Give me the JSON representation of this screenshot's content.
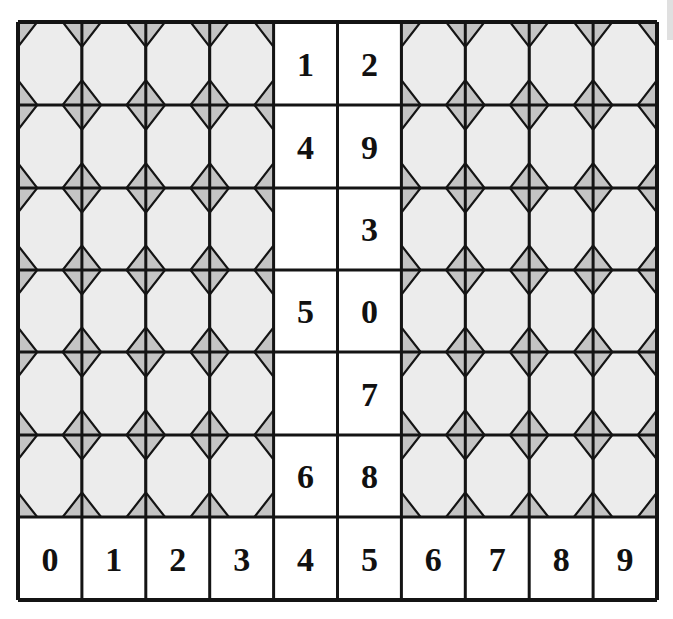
{
  "puzzle": {
    "columns": 10,
    "rows": 6,
    "open_columns": [
      4,
      5
    ],
    "grid_cells": [
      [
        "1",
        "2"
      ],
      [
        "4",
        "9"
      ],
      [
        "",
        "3"
      ],
      [
        "5",
        "0"
      ],
      [
        "",
        "7"
      ],
      [
        "6",
        "8"
      ]
    ],
    "answer_row": [
      "0",
      "1",
      "2",
      "3",
      "4",
      "5",
      "6",
      "7",
      "8",
      "9"
    ]
  },
  "colors": {
    "tile_light": "#ececec",
    "tile_corner": "#c4c4c4",
    "line": "#141414",
    "cell_white": "#ffffff"
  }
}
